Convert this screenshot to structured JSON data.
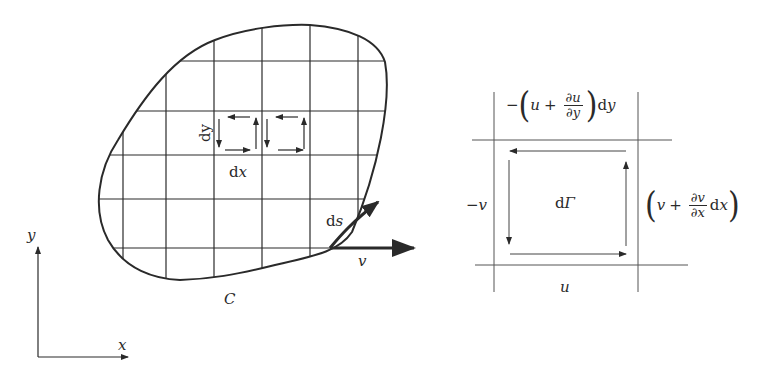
{
  "left_figure": {
    "region_label": "C",
    "dx_label": "dx",
    "dy_label": "dy",
    "ds_label": "ds",
    "velocity_label": "v",
    "axes": {
      "x_label": "x",
      "y_label": "y"
    },
    "grid": {
      "vertical_lines_x": [
        123,
        166,
        214,
        262,
        310,
        358
      ],
      "horizontal_lines_y": [
        61,
        111,
        155,
        199,
        248
      ]
    }
  },
  "right_figure": {
    "top_expression": {
      "prefix": "−",
      "var": "u",
      "plus": "+",
      "num": "∂u",
      "den": "∂y",
      "suffix": "dy"
    },
    "right_expression": {
      "var": "v",
      "plus": "+",
      "num": "∂v",
      "den": "∂x",
      "suffix": "dx"
    },
    "left_label": "−v",
    "bottom_label": "u",
    "center_label": "dΓ"
  },
  "colors": {
    "ink": "#2a2a2a",
    "light_ink": "#555555",
    "background": "#ffffff"
  }
}
